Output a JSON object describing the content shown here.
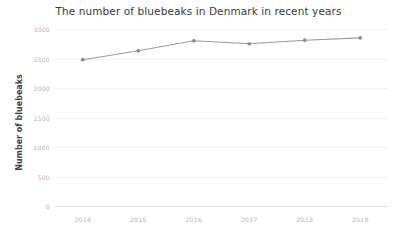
{
  "chart_data": {
    "type": "line",
    "title": "The number of bluebeaks in Denmark in recent years",
    "xlabel": "",
    "ylabel": "Number of bluebeaks",
    "categories": [
      "2014",
      "2015",
      "2016",
      "2017",
      "2018",
      "2019"
    ],
    "values": [
      2480,
      2630,
      2800,
      2750,
      2810,
      2850
    ],
    "series": [
      {
        "name": "Number of bluebeaks",
        "values": [
          2480,
          2630,
          2800,
          2750,
          2810,
          2850
        ]
      }
    ],
    "ylim": [
      0,
      3000
    ],
    "ytick_labels": [
      "3000",
      "2500",
      "2000",
      "1500",
      "1000",
      "500",
      "0"
    ],
    "ytick_values": [
      3000,
      2500,
      2000,
      1500,
      1000,
      500,
      0
    ],
    "xtick_labels": [
      "2014",
      "2015",
      "2016",
      "2017",
      "2018",
      "2019"
    ],
    "grid": true,
    "legend": false,
    "legend_position": "none",
    "line_color": "#9a9a9a",
    "marker_color": "#8d8d8d",
    "grid_color": "#f2f2f2",
    "title_color": "#3a3a3a",
    "tick_label_color": "#b4b4b4",
    "axis_title_color": "#3f3f3f",
    "background_color": "#ffffff"
  }
}
